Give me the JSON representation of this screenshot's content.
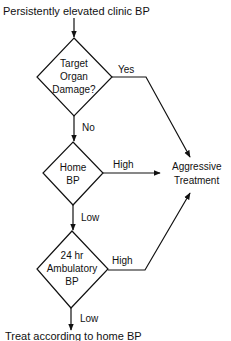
{
  "flowchart": {
    "start": "Persistently elevated clinic BP",
    "decision1": {
      "line1": "Target",
      "line2": "Organ",
      "line3": "Damage?"
    },
    "decision2": {
      "line1": "Home",
      "line2": "BP"
    },
    "decision3": {
      "line1": "24 hr",
      "line2": "Ambulatory",
      "line3": "BP"
    },
    "outcome_aggressive": {
      "line1": "Aggressive",
      "line2": "Treatment"
    },
    "end": "Treat according to home BP",
    "edge_labels": {
      "yes": "Yes",
      "no": "No",
      "high_home": "High",
      "low_home": "Low",
      "high_ambulatory": "High",
      "low_ambulatory": "Low"
    },
    "colors": {
      "line": "#111111",
      "background": "#ffffff"
    }
  }
}
